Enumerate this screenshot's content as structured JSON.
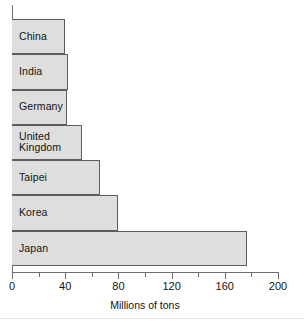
{
  "chart_data": {
    "type": "bar",
    "orientation": "horizontal",
    "title": "",
    "xlabel": "Millions of tons",
    "ylabel": "",
    "categories": [
      "China",
      "India",
      "Germany",
      "United Kingdom",
      "Taipei",
      "Korea",
      "Japan"
    ],
    "values": [
      40,
      42,
      41,
      53,
      66,
      80,
      177
    ],
    "xlim": [
      0,
      200
    ],
    "xticks": [
      0,
      40,
      80,
      120,
      160,
      200
    ],
    "xtick_labels": [
      "0",
      "40",
      "80",
      "120",
      "160",
      "200"
    ],
    "minor_xticks": [
      20,
      60,
      100,
      140,
      180
    ],
    "grid": false,
    "legend": null,
    "bar_fill_color": "#dededc",
    "bar_border_color": "#5d5d5d",
    "axis_color": "#6e6e6e",
    "text_color": "#141414",
    "bars": [
      {
        "label": "China",
        "value": 40
      },
      {
        "label": "India",
        "value": 42
      },
      {
        "label": "Germany",
        "value": 41
      },
      {
        "label": "United Kingdom",
        "value": 53
      },
      {
        "label": "Taipei",
        "value": 66
      },
      {
        "label": "Korea",
        "value": 80
      },
      {
        "label": "Japan",
        "value": 177
      }
    ]
  },
  "axis": {
    "title": "Millions of tons",
    "tick_labels": [
      "0",
      "40",
      "80",
      "120",
      "160",
      "200"
    ]
  }
}
